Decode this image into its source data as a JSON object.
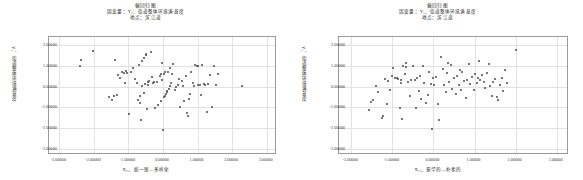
{
  "charts": [
    {
      "title_line1": "偏回归图",
      "title_line2": "因变量：Y₁、街道整体环境满意度",
      "title_line3": "地点：滨江道",
      "ylabel": "Y₁、街道整体环境满意度",
      "xlabel": "X₁₁、统一感—多样化",
      "xticks": [
        "-3.00000",
        "-2.00000",
        "-1.00000",
        "0.00000",
        "1.00000",
        "2.00000",
        "3.00000"
      ],
      "yticks": [
        "2.00000",
        "1.00000",
        "0.00000",
        "-1.00000",
        "-2.00000",
        "-3.00000"
      ]
    },
    {
      "title_line1": "偏回归图",
      "title_line2": "因变量：Y₁、街道整体环境满意度",
      "title_line3": "地点：滨江道",
      "ylabel": "Y₁、街道整体环境满意度",
      "xlabel": "X₁₄、豪华的—朴素的",
      "xticks": [
        "-2.00000",
        "-1.00000",
        "0.00000",
        "1.00000",
        "2.00000",
        "3.00000"
      ],
      "yticks": [
        "2.00000",
        "1.00000",
        "0.00000",
        "-1.00000",
        "-2.00000",
        "-3.00000"
      ]
    }
  ],
  "chart_data": [
    {
      "type": "scatter",
      "title": "偏回归图 — 因变量：Y₁、街道整体环境满意度 — 地点：滨江道",
      "xlabel": "X₁₁、统一感—多样化",
      "ylabel": "Y₁、街道整体环境满意度",
      "xlim": [
        -3.3,
        3.3
      ],
      "ylim": [
        -3.3,
        2.4
      ],
      "xticks": [
        -3,
        -2,
        -1,
        0,
        1,
        2,
        3
      ],
      "yticks": [
        2,
        1,
        0,
        -1,
        -2,
        -3
      ],
      "grid": true,
      "legend": "none",
      "marker": "filled-circle",
      "marker_color": "#4a4a4a",
      "points": [
        [
          -2.38,
          1.3
        ],
        [
          -2.4,
          1.02
        ],
        [
          -2.02,
          1.7
        ],
        [
          -1.55,
          -0.52
        ],
        [
          -1.47,
          -0.63
        ],
        [
          -1.42,
          -0.45
        ],
        [
          -1.38,
          1.27
        ],
        [
          -1.33,
          -0.38
        ],
        [
          -1.3,
          0.55
        ],
        [
          -1.24,
          0.4
        ],
        [
          -1.2,
          0.72
        ],
        [
          -1.12,
          0.68
        ],
        [
          -1.1,
          0.2
        ],
        [
          -1.07,
          0.78
        ],
        [
          -1.03,
          0.65
        ],
        [
          -0.98,
          -1.33
        ],
        [
          -0.92,
          0.72
        ],
        [
          -0.86,
          0.9
        ],
        [
          -0.8,
          0.38
        ],
        [
          -0.76,
          0.18
        ],
        [
          -0.72,
          -0.62
        ],
        [
          -0.7,
          1.05
        ],
        [
          -0.68,
          -0.78
        ],
        [
          -0.66,
          -0.45
        ],
        [
          -0.64,
          -1.62
        ],
        [
          -0.62,
          0.02
        ],
        [
          -0.6,
          1.22
        ],
        [
          -0.56,
          -0.3
        ],
        [
          -0.54,
          1.4
        ],
        [
          -0.52,
          0.12
        ],
        [
          -0.5,
          1.52
        ],
        [
          -0.48,
          1.6
        ],
        [
          -0.46,
          -1.06
        ],
        [
          -0.44,
          0.22
        ],
        [
          -0.42,
          0.1
        ],
        [
          -0.4,
          0.28
        ],
        [
          -0.36,
          1.66
        ],
        [
          -0.33,
          0.45
        ],
        [
          -0.3,
          0.16
        ],
        [
          -0.26,
          0.22
        ],
        [
          -0.22,
          -1.02
        ],
        [
          -0.18,
          0.24
        ],
        [
          -0.14,
          -0.88
        ],
        [
          -0.1,
          0.5
        ],
        [
          -0.07,
          -0.7
        ],
        [
          -0.05,
          0.6
        ],
        [
          -0.03,
          1.12
        ],
        [
          -0.02,
          0.32
        ],
        [
          0.0,
          -2.1
        ],
        [
          0.02,
          -0.5
        ],
        [
          0.04,
          0.62
        ],
        [
          0.05,
          0.7
        ],
        [
          0.07,
          -0.44
        ],
        [
          0.09,
          -0.36
        ],
        [
          0.11,
          -0.28
        ],
        [
          0.13,
          -0.2
        ],
        [
          0.15,
          0.72
        ],
        [
          0.17,
          -0.12
        ],
        [
          0.19,
          0.9
        ],
        [
          0.21,
          0.04
        ],
        [
          0.23,
          0.18
        ],
        [
          0.26,
          0.6
        ],
        [
          0.3,
          1.1
        ],
        [
          0.34,
          -0.18
        ],
        [
          0.38,
          0.0
        ],
        [
          0.42,
          0.08
        ],
        [
          0.46,
          0.36
        ],
        [
          0.5,
          -0.96
        ],
        [
          0.54,
          0.28
        ],
        [
          0.58,
          0.04
        ],
        [
          0.62,
          -0.68
        ],
        [
          0.66,
          0.52
        ],
        [
          0.7,
          -1.26
        ],
        [
          0.72,
          -1.42
        ],
        [
          0.74,
          -0.6
        ],
        [
          0.78,
          -0.34
        ],
        [
          0.82,
          0.72
        ],
        [
          0.86,
          0.16
        ],
        [
          0.9,
          0.04
        ],
        [
          0.94,
          1.06
        ],
        [
          0.98,
          0.98
        ],
        [
          1.0,
          1.02
        ],
        [
          1.02,
          0.1
        ],
        [
          1.06,
          0.06
        ],
        [
          1.1,
          -0.42
        ],
        [
          1.14,
          1.04
        ],
        [
          1.18,
          0.12
        ],
        [
          1.22,
          0.08
        ],
        [
          1.26,
          -1.2
        ],
        [
          1.3,
          0.14
        ],
        [
          1.36,
          0.58
        ],
        [
          1.42,
          -0.98
        ],
        [
          1.48,
          1.02
        ],
        [
          1.54,
          0.1
        ],
        [
          1.6,
          0.62
        ],
        [
          2.28,
          0.02
        ]
      ]
    },
    {
      "type": "scatter",
      "title": "偏回归图 — 因变量：Y₁、街道整体环境满意度 — 地点：滨江道",
      "xlabel": "X₁₄、豪华的—朴素的",
      "ylabel": "Y₁、街道整体环境满意度",
      "xlim": [
        -2.3,
        3.3
      ],
      "ylim": [
        -3.3,
        2.4
      ],
      "xticks": [
        -2,
        -1,
        0,
        1,
        2,
        3
      ],
      "yticks": [
        2,
        1,
        0,
        -1,
        -2,
        -3
      ],
      "grid": true,
      "legend": "none",
      "marker": "filled-circle",
      "marker_color": "#4a4a4a",
      "points": [
        [
          -1.56,
          -1.12
        ],
        [
          -1.52,
          -0.72
        ],
        [
          -1.48,
          -0.64
        ],
        [
          -1.4,
          0.02
        ],
        [
          -1.34,
          -0.28
        ],
        [
          -1.26,
          -1.52
        ],
        [
          -1.22,
          -1.44
        ],
        [
          -1.18,
          0.36
        ],
        [
          -1.14,
          -0.84
        ],
        [
          -1.1,
          0.26
        ],
        [
          -1.06,
          -0.18
        ],
        [
          -1.02,
          0.54
        ],
        [
          -0.98,
          0.88
        ],
        [
          -0.94,
          0.44
        ],
        [
          -0.9,
          0.4
        ],
        [
          -0.86,
          0.38
        ],
        [
          -0.82,
          -1.02
        ],
        [
          -0.8,
          0.2
        ],
        [
          -0.78,
          0.3
        ],
        [
          -0.76,
          -1.56
        ],
        [
          -0.74,
          1.02
        ],
        [
          -0.7,
          0.62
        ],
        [
          -0.68,
          1.12
        ],
        [
          -0.66,
          0.96
        ],
        [
          -0.62,
          0.24
        ],
        [
          -0.58,
          -0.46
        ],
        [
          -0.54,
          0.34
        ],
        [
          -0.5,
          1.0
        ],
        [
          -0.46,
          0.32
        ],
        [
          -0.42,
          -1.04
        ],
        [
          -0.4,
          0.42
        ],
        [
          -0.36,
          -0.22
        ],
        [
          -0.34,
          0.52
        ],
        [
          -0.3,
          -0.6
        ],
        [
          -0.26,
          0.98
        ],
        [
          -0.22,
          0.18
        ],
        [
          -0.18,
          -0.78
        ],
        [
          -0.14,
          -0.4
        ],
        [
          -0.1,
          0.72
        ],
        [
          -0.06,
          0.14
        ],
        [
          -0.02,
          0.44
        ],
        [
          0.02,
          0.08
        ],
        [
          0.06,
          0.46
        ],
        [
          0.1,
          -0.82
        ],
        [
          0.14,
          -1.6
        ],
        [
          0.18,
          1.42
        ],
        [
          0.22,
          0.86
        ],
        [
          0.26,
          0.06
        ],
        [
          0.3,
          -0.26
        ],
        [
          0.34,
          0.64
        ],
        [
          0.38,
          0.22
        ],
        [
          0.42,
          1.06
        ],
        [
          0.46,
          -0.1
        ],
        [
          0.5,
          0.4
        ],
        [
          0.54,
          -0.34
        ],
        [
          0.58,
          0.52
        ],
        [
          0.62,
          0.1
        ],
        [
          0.66,
          -0.16
        ],
        [
          0.7,
          0.7
        ],
        [
          0.74,
          0.26
        ],
        [
          0.78,
          -0.56
        ],
        [
          0.82,
          0.34
        ],
        [
          0.86,
          1.08
        ],
        [
          0.9,
          0.12
        ],
        [
          0.94,
          0.48
        ],
        [
          0.98,
          -0.14
        ],
        [
          1.02,
          0.6
        ],
        [
          1.06,
          0.18
        ],
        [
          1.1,
          1.26
        ],
        [
          1.14,
          0.3
        ],
        [
          1.18,
          0.56
        ],
        [
          1.22,
          0.22
        ],
        [
          1.26,
          -0.06
        ],
        [
          1.3,
          0.66
        ],
        [
          1.34,
          1.08
        ],
        [
          1.38,
          0.02
        ],
        [
          1.42,
          -0.44
        ],
        [
          1.46,
          0.24
        ],
        [
          1.5,
          0.38
        ],
        [
          1.54,
          -0.52
        ],
        [
          1.58,
          -0.66
        ],
        [
          1.62,
          0.08
        ],
        [
          1.66,
          0.44
        ],
        [
          1.7,
          -0.2
        ],
        [
          1.74,
          0.8
        ],
        [
          1.78,
          0.16
        ],
        [
          -0.04,
          -2.06
        ],
        [
          0.36,
          1.16
        ],
        [
          0.64,
          0.8
        ],
        [
          1.08,
          0.44
        ],
        [
          2.02,
          1.78
        ]
      ]
    }
  ]
}
